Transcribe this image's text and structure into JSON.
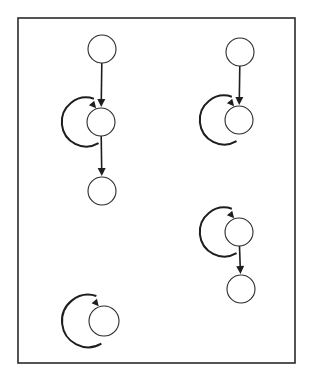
{
  "figure": {
    "frame": {
      "x": 18,
      "y": 18,
      "width": 277,
      "height": 345
    },
    "colors": {
      "stroke": "#1e1e1e",
      "node_fill": "#ffffff",
      "background": "#ffffff"
    },
    "graphs": [
      {
        "id": "graph-top-left",
        "nodes": [
          {
            "id": "a1",
            "cx": 102,
            "cy": 49,
            "r": 14
          },
          {
            "id": "a2",
            "cx": 101,
            "cy": 122,
            "r": 14
          },
          {
            "id": "a3",
            "cx": 102,
            "cy": 191,
            "r": 14
          }
        ],
        "edges": [
          {
            "from": "a1",
            "to": "a2"
          },
          {
            "from": "a2",
            "to": "a3"
          }
        ],
        "self_loops": [
          "a2"
        ]
      },
      {
        "id": "graph-top-right",
        "nodes": [
          {
            "id": "b1",
            "cx": 240,
            "cy": 52,
            "r": 14
          },
          {
            "id": "b2",
            "cx": 239,
            "cy": 120,
            "r": 14
          }
        ],
        "edges": [
          {
            "from": "b1",
            "to": "b2"
          }
        ],
        "self_loops": [
          "b2"
        ]
      },
      {
        "id": "graph-middle-right",
        "nodes": [
          {
            "id": "c1",
            "cx": 239,
            "cy": 232,
            "r": 14
          },
          {
            "id": "c2",
            "cx": 241,
            "cy": 289,
            "r": 14
          }
        ],
        "edges": [
          {
            "from": "c1",
            "to": "c2"
          }
        ],
        "self_loops": [
          "c1"
        ]
      },
      {
        "id": "graph-bottom-left",
        "nodes": [
          {
            "id": "d1",
            "cx": 104,
            "cy": 321,
            "r": 15
          }
        ],
        "edges": [],
        "self_loops": [
          "d1"
        ]
      }
    ]
  }
}
